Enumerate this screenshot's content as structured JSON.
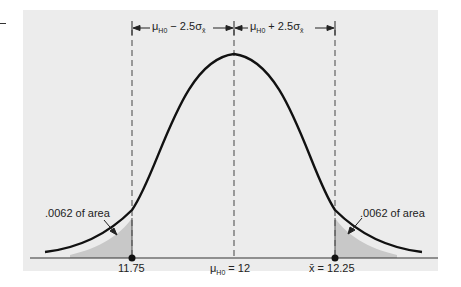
{
  "figure": {
    "type": "normal-distribution-two-tailed-test",
    "top_labels": {
      "left": {
        "mu": "μ",
        "sub": "H",
        "subsub": "0",
        "rest": " − 2.5σ",
        "sigma_sub": "x̄"
      },
      "right": {
        "mu": "μ",
        "sub": "H",
        "subsub": "0",
        "rest": " + 2.5σ",
        "sigma_sub": "x̄"
      }
    },
    "tail_labels": {
      "left": ".0062 of area",
      "right": ".0062 of area"
    },
    "axis_labels": {
      "left_critical": "11.75",
      "center_mu": "μ",
      "center_sub": "H",
      "center_subsub": "0",
      "center_value": " = 12",
      "right_xbar": "x̄",
      "right_value": " = 12.25"
    },
    "colors": {
      "panel_bg": "#ececec",
      "curve": "#111111",
      "shade": "#c8c8c8",
      "lines": "#333333"
    }
  }
}
